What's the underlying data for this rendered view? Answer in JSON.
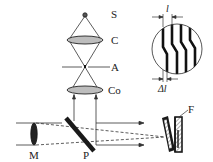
{
  "labels": {
    "source": "S",
    "condenser": "C",
    "aperture": "A",
    "collimator": "Co",
    "lens_m": "M",
    "plate": "P",
    "sample": "F",
    "fringe_spacing": "l",
    "fringe_shift": "Δl"
  },
  "colors": {
    "lens_fill": "#bdbdbd",
    "line": "#333333",
    "dark": "#1a1a1a",
    "hatch": "#888888"
  },
  "components": [
    {
      "id": "S",
      "type": "point-source"
    },
    {
      "id": "C",
      "type": "condenser-lens"
    },
    {
      "id": "A",
      "type": "aperture"
    },
    {
      "id": "Co",
      "type": "collimator-lens"
    },
    {
      "id": "M",
      "type": "lens"
    },
    {
      "id": "P",
      "type": "beam-splitter-plate"
    },
    {
      "id": "F",
      "type": "wedge-film-sample"
    }
  ],
  "inset": {
    "type": "interference-fringes",
    "fringe_count": 4,
    "dimension_top": "l",
    "dimension_bottom": "Δl"
  }
}
